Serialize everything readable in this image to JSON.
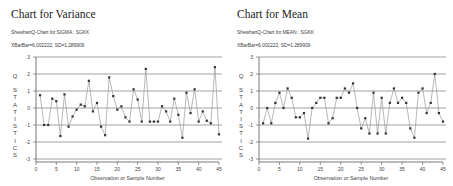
{
  "chart_data": [
    {
      "type": "line",
      "title": "Chart for Variance",
      "subtitle": "ShewhartQ-Chart for SIGMA : SGKK",
      "subtitle2": "XBarBar=6.002222, SD=1.289909",
      "xlabel": "Observation or Sample Number",
      "ylabel": "Q STATISTICS",
      "xlim": [
        0,
        45
      ],
      "ylim": [
        -3,
        3
      ],
      "x_ticks": [
        0,
        5,
        10,
        15,
        20,
        25,
        30,
        35,
        40,
        45
      ],
      "y_ticks": [
        3,
        2,
        1,
        0,
        -1,
        -2,
        -3
      ],
      "grid": true,
      "x": [
        1,
        2,
        3,
        4,
        5,
        6,
        7,
        8,
        9,
        10,
        11,
        12,
        13,
        14,
        15,
        16,
        17,
        18,
        19,
        20,
        21,
        22,
        23,
        24,
        25,
        26,
        27,
        28,
        29,
        30,
        31,
        32,
        33,
        34,
        35,
        36,
        37,
        38,
        39,
        40,
        41,
        42,
        43,
        44,
        45
      ],
      "values": [
        0.75,
        -1.0,
        -1.0,
        0.55,
        0.4,
        -1.65,
        0.8,
        -1.1,
        -0.5,
        -0.1,
        0.2,
        0.1,
        1.6,
        -0.2,
        0.3,
        -1.1,
        -1.6,
        1.8,
        0.7,
        -0.1,
        0.1,
        -0.55,
        -0.8,
        1.1,
        0.5,
        -0.8,
        2.3,
        -0.8,
        -0.8,
        -0.8,
        0.1,
        -0.2,
        -0.8,
        0.55,
        -0.4,
        -1.75,
        0.9,
        -0.3,
        1.1,
        -0.8,
        -0.2,
        -0.75,
        -0.9,
        2.4,
        -1.55
      ]
    },
    {
      "type": "line",
      "title": "Chart for Mean",
      "subtitle": "ShewhartQ-Chart for MEAN : SGKK",
      "subtitle2": "XBarBar=6.002222, SD=1.289909",
      "xlabel": "Observation or Sample Number",
      "ylabel": "Q STATISTICS",
      "xlim": [
        0,
        45
      ],
      "ylim": [
        -3,
        3
      ],
      "x_ticks": [
        0,
        5,
        10,
        15,
        20,
        25,
        30,
        35,
        40,
        45
      ],
      "y_ticks": [
        3,
        2,
        1,
        0,
        -1,
        -2,
        -3
      ],
      "grid": true,
      "x": [
        1,
        2,
        3,
        4,
        5,
        6,
        7,
        8,
        9,
        10,
        11,
        12,
        13,
        14,
        15,
        16,
        17,
        18,
        19,
        20,
        21,
        22,
        23,
        24,
        25,
        26,
        27,
        28,
        29,
        30,
        31,
        32,
        33,
        34,
        35,
        36,
        37,
        38,
        39,
        40,
        41,
        42,
        43,
        44,
        45
      ],
      "values": [
        -0.9,
        0.0,
        -0.9,
        0.3,
        0.9,
        0.0,
        1.15,
        0.6,
        -0.55,
        -0.55,
        -0.3,
        -1.8,
        0.0,
        0.3,
        0.6,
        0.6,
        -0.9,
        -0.6,
        0.6,
        0.6,
        1.15,
        0.9,
        1.45,
        0.0,
        -1.2,
        -0.6,
        -1.5,
        0.9,
        -1.5,
        0.6,
        -1.5,
        0.3,
        1.15,
        0.3,
        0.6,
        0.3,
        -1.2,
        -1.75,
        0.9,
        1.15,
        -0.3,
        0.3,
        2.0,
        -0.3,
        -0.8
      ]
    }
  ],
  "panels": {
    "left": {
      "title": "Chart for Variance",
      "subtitle": "ShewhartQ-Chart for SIGMA : SGKK",
      "subtitle2": "XBarBar=6.002222, SD=1.289909"
    },
    "right": {
      "title": "Chart for Mean",
      "subtitle": "ShewhartQ-Chart for MEAN : SGKK",
      "subtitle2": "XBarBar=6.002222, SD=1.289909"
    }
  },
  "axis": {
    "xlabel": "Observation or Sample Number",
    "ylabel_letters": [
      "Q",
      "S",
      "T",
      "A",
      "T",
      "I",
      "S",
      "T",
      "I",
      "C",
      "S"
    ]
  },
  "colors": {
    "grid": "#8a8a8a",
    "axis": "#555555",
    "line": "#9a9a9a",
    "marker": "#333333"
  }
}
